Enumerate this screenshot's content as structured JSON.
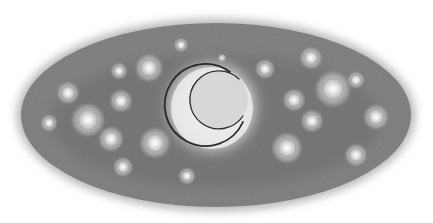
{
  "scene": {
    "description": "Pencil drawing of a crescent moon in a starry night sky within an oval",
    "background_color": "#ffffff",
    "oval": {
      "cx": 216,
      "cy": 115,
      "rx": 195,
      "ry": 92,
      "fill": "#858585",
      "dark": "#6a6a6a",
      "rim": "#b4b4b4"
    },
    "moon": {
      "glow": {
        "cx": 212,
        "cy": 107,
        "r": 52,
        "color": "#dcdcdc"
      },
      "outer": {
        "cx": 212,
        "cy": 108,
        "r": 41
      },
      "inner": {
        "cx": 219,
        "cy": 100,
        "r": 29
      },
      "disc_color": "#ececec",
      "outline_color": "#2a2a2a"
    },
    "stars": [
      {
        "x": 149,
        "y": 68,
        "r": 10
      },
      {
        "x": 119,
        "y": 71,
        "r": 6
      },
      {
        "x": 121,
        "y": 101,
        "r": 8
      },
      {
        "x": 88,
        "y": 120,
        "r": 12
      },
      {
        "x": 111,
        "y": 139,
        "r": 9
      },
      {
        "x": 155,
        "y": 143,
        "r": 11
      },
      {
        "x": 68,
        "y": 93,
        "r": 8
      },
      {
        "x": 49,
        "y": 123,
        "r": 6
      },
      {
        "x": 123,
        "y": 167,
        "r": 7
      },
      {
        "x": 187,
        "y": 176,
        "r": 6
      },
      {
        "x": 181,
        "y": 45,
        "r": 5
      },
      {
        "x": 265,
        "y": 69,
        "r": 7
      },
      {
        "x": 311,
        "y": 58,
        "r": 8
      },
      {
        "x": 333,
        "y": 89,
        "r": 13
      },
      {
        "x": 356,
        "y": 80,
        "r": 6
      },
      {
        "x": 294,
        "y": 100,
        "r": 8
      },
      {
        "x": 312,
        "y": 121,
        "r": 8
      },
      {
        "x": 376,
        "y": 117,
        "r": 9
      },
      {
        "x": 287,
        "y": 148,
        "r": 11
      },
      {
        "x": 356,
        "y": 155,
        "r": 8
      },
      {
        "x": 222,
        "y": 58,
        "r": 3
      }
    ]
  }
}
